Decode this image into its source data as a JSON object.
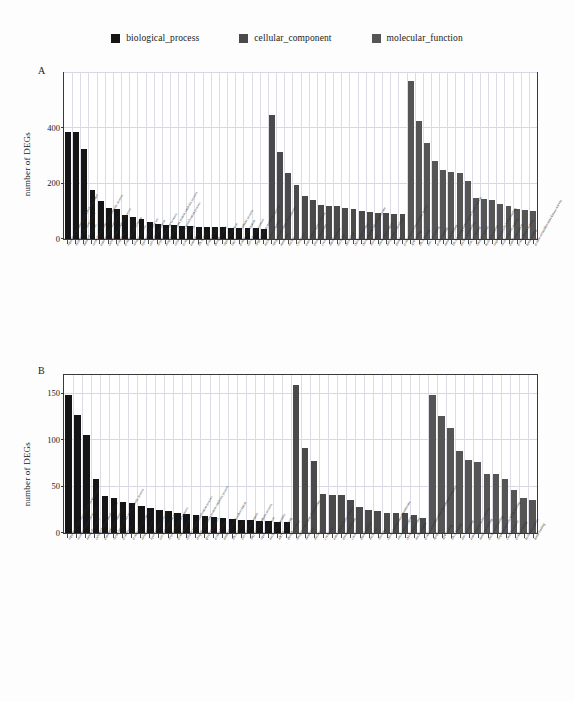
{
  "legend": {
    "items": [
      {
        "label": "biological_process",
        "color": "#151515",
        "name": "legend-biological-process"
      },
      {
        "label": "cellular_component",
        "color": "#4a4a4a",
        "name": "legend-cellular-component"
      },
      {
        "label": "molecular_function",
        "color": "#555555",
        "name": "legend-molecular-function"
      }
    ]
  },
  "panels": [
    {
      "letter": "A",
      "ylabel": "number of DEGs"
    },
    {
      "letter": "B",
      "ylabel": "number of DEGs"
    }
  ],
  "chart_data": [
    {
      "type": "bar",
      "title": "A",
      "xlabel": "",
      "ylabel": "number of DEGs",
      "ylim": [
        0,
        600
      ],
      "yticks": [
        0,
        200,
        400
      ],
      "grid": true,
      "legend_position": "top-center",
      "categories": [
        "regulation of transcription, DNA-templated",
        "oxidation-reduction process",
        "metabolic process",
        "serine family amino acid metabolic process",
        "transmembrane transport",
        "carbohydrate metabolic process",
        "proteolysis",
        "protein phosphorylation",
        "defense response",
        "lipid metabolic process",
        "cell wall organization",
        "response to oxidative stress",
        "ubiquitin-dependent protein catabolic process",
        "cellular protein modification process",
        "protein transport",
        "translation",
        "DNA repair",
        "protein folding",
        "phosphorylation",
        "signal transduction",
        "fatty acid biosynthetic process",
        "protein ubiquitination",
        "cell redox homeostasis",
        "single-organism metabolic process",
        "nucleosome assembly",
        "integral component of membrane",
        "membrane",
        "nucleus",
        "cytoplasm",
        "transcription factor complex",
        "plasma membrane",
        "cytosol",
        "mitochondrion",
        "nucleolus",
        "chloroplast",
        "chloroplast stroma",
        "chloroplast thylakoid membrane",
        "ribosome",
        "extracellular region",
        "endoplasmic reticulum",
        "plastid",
        "proteinaceous extracellular matrix",
        "ATP binding",
        "DNA binding",
        "zinc ion binding",
        "protein binding",
        "metal ion binding",
        "DNA-binding transcription factor activity",
        "nucleic acid binding",
        "iron ion binding",
        "catalytic activity",
        "hydrolase activity",
        "sequence-specific DNA binding",
        "oxidoreductase activity",
        "transferase activity",
        "protein kinase activity",
        "heme binding",
        "protein serine/threonine kinase activity"
      ],
      "series": [
        {
          "name": "biological_process",
          "color": "#151515",
          "start_index": 0,
          "values": [
            388,
            387,
            326,
            178,
            138,
            113,
            107,
            86,
            80,
            72,
            60,
            56,
            52,
            50,
            48,
            46,
            45,
            44,
            43,
            42,
            41,
            40,
            40,
            39,
            38
          ]
        },
        {
          "name": "cellular_component",
          "color": "#4a4a4a",
          "start_index": 25,
          "values": [
            448,
            315,
            240,
            195,
            155,
            140,
            123,
            120,
            118,
            112,
            108,
            100,
            96,
            94,
            93,
            92,
            90
          ]
        },
        {
          "name": "molecular_function",
          "color": "#555555",
          "start_index": 42,
          "values": [
            571,
            428,
            348,
            282,
            250,
            244,
            238,
            210,
            150,
            143,
            140,
            128,
            118,
            110,
            105,
            100,
            96
          ]
        }
      ]
    },
    {
      "type": "bar",
      "title": "B",
      "xlabel": "",
      "ylabel": "number of DEGs",
      "ylim": [
        0,
        170
      ],
      "yticks": [
        0,
        50,
        100,
        150
      ],
      "grid": true,
      "legend_position": "top-center",
      "categories": [
        "regulation of transcription, DNA-templated",
        "oxidation-reduction process",
        "metabolic process",
        "carbohydrate metabolic process",
        "transmembrane transport",
        "serine family amino acid metabolic process",
        "proteolysis",
        "protein phosphorylation",
        "defense response",
        "lipid metabolic process",
        "cell wall organization",
        "response to oxidative stress",
        "protein transport",
        "cellular protein modification process",
        "ubiquitin-dependent protein catabolic process",
        "glycolytic process",
        "protein folding",
        "peptidyl-serine phosphorylation",
        "DNA replication",
        "cell redox homeostasis",
        "fatty acid biosynthetic process",
        "signal transduction",
        "nucleosome assembly",
        "mRNA processing",
        "phosphorylation",
        "integral component of membrane",
        "membrane",
        "nucleus",
        "cytoplasm",
        "transcription factor complex",
        "plasma membrane",
        "cytosol",
        "mitochondrion",
        "nucleolus",
        "ribosome",
        "chloroplast thylakoid membrane",
        "extracellular region",
        "chloroplast stroma",
        "nuclear matrix",
        "protein serine/threonine phosphatase complex",
        "apoplast",
        "ATP binding",
        "DNA binding",
        "zinc ion binding",
        "transcription factor activity",
        "metal ion binding",
        "nucleic acid binding",
        "sequence-specific DNA binding",
        "catalytic activity",
        "protein binding",
        "hydrolase activity",
        "heme binding"
      ],
      "series": [
        {
          "name": "biological_process",
          "color": "#151515",
          "start_index": 0,
          "values": [
            148,
            127,
            105,
            58,
            40,
            38,
            33,
            32,
            29,
            27,
            25,
            24,
            22,
            20,
            19,
            18,
            17,
            16,
            15,
            14,
            14,
            13,
            13,
            12,
            12
          ]
        },
        {
          "name": "cellular_component",
          "color": "#4a4a4a",
          "start_index": 25,
          "values": [
            159,
            92,
            77,
            42,
            41,
            41,
            35,
            28,
            25,
            24,
            22,
            22,
            21,
            19,
            16
          ]
        },
        {
          "name": "molecular_function",
          "color": "#555555",
          "start_index": 40,
          "values": [
            148,
            126,
            113,
            88,
            79,
            76,
            64,
            64,
            58,
            46,
            38,
            35
          ]
        }
      ]
    }
  ]
}
